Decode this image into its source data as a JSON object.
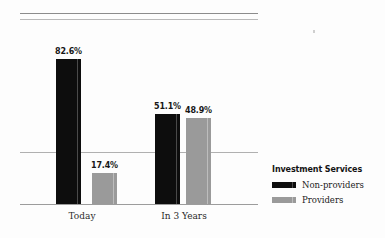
{
  "chart_data": {
    "type": "bar",
    "title": "",
    "xlabel": "",
    "ylabel": "",
    "ylim": [
      0,
      100
    ],
    "grid": true,
    "gridlines": [
      29.5
    ],
    "legend_position": "right",
    "legend_title": "Investment Services",
    "categories": [
      "Today",
      "In 3 Years"
    ],
    "series": [
      {
        "name": "Non-providers",
        "color": "#0d0d0d",
        "values": [
          82.6,
          48.9
        ],
        "labels": [
          "82.6%",
          "51.1%"
        ]
      },
      {
        "name": "Providers",
        "color": "#9a9a9a",
        "values": [
          17.4,
          48.9
        ],
        "labels": [
          "17.4%",
          "48.9%"
        ]
      }
    ],
    "bars": [
      {
        "category": "Today",
        "series": "Non-providers",
        "value": 82.6,
        "label": "82.6%"
      },
      {
        "category": "Today",
        "series": "Providers",
        "value": 17.4,
        "label": "17.4%"
      },
      {
        "category": "In 3 Years",
        "series": "Non-providers",
        "value": 51.1,
        "label": "51.1%"
      },
      {
        "category": "In 3 Years",
        "series": "Providers",
        "value": 48.9,
        "label": "48.9%"
      }
    ]
  },
  "legend": {
    "title": "Investment Services",
    "items": [
      {
        "label": "Non-providers",
        "color": "#0d0d0d"
      },
      {
        "label": "Providers",
        "color": "#9a9a9a"
      }
    ]
  },
  "axis": {
    "categories": [
      "Today",
      "In 3 Years"
    ]
  },
  "colors": {
    "background": "#fdfdfd",
    "non_providers": "#0d0d0d",
    "providers": "#9a9a9a",
    "gridline": "#b0b0b0",
    "axis": "#9c9c9c",
    "rule_top": "#8c8c8c",
    "rule_bottom": "#b9b9b9"
  }
}
